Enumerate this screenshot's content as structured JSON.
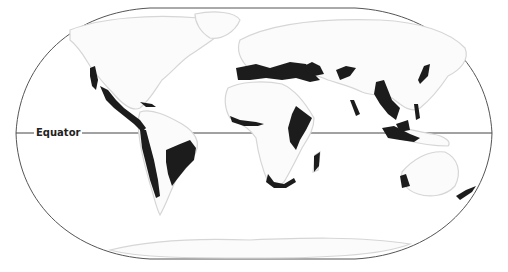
{
  "map": {
    "projection_shape": "rounded-oval world map",
    "background_color": "#ffffff",
    "land_color": "#fbfbfb",
    "highlight_color": "#1c1c1c",
    "frame_color": "#555555",
    "labels": {
      "equator": "Equator"
    },
    "highlighted_regions": [
      "Western North America / California coast",
      "Mexico and Central America",
      "Caribbean (Cuba, Hispaniola)",
      "Andean western coast of South America",
      "Eastern Brazil / Atlantic Forest",
      "Mediterranean Basin",
      "West African coast",
      "Horn of Africa / East Africa",
      "Madagascar",
      "Southern Africa coast",
      "Caucasus and Middle East",
      "Central Asian mountains",
      "Western Ghats / Sri Lanka",
      "Indo-Burma / Southeast Asia",
      "Japan",
      "Philippines",
      "Sundaland / Indonesia",
      "New Guinea",
      "Southwest Australia",
      "New Zealand"
    ]
  }
}
